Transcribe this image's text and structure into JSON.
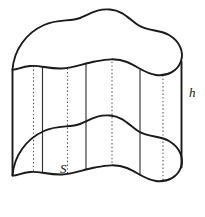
{
  "figure": {
    "type": "geometry-diagram",
    "background_color": "#ffffff",
    "stroke_color": "#1a1a1a",
    "hidden_stroke_color": "#555555",
    "width_px": 205,
    "height_px": 217,
    "labels": {
      "cross_section": "S",
      "height": "h"
    },
    "label_positions": {
      "cross_section": {
        "x": 60,
        "y": 162
      },
      "height": {
        "x": 189,
        "y": 86
      }
    },
    "geometry": {
      "height_offset_px": 106,
      "top_face_center": {
        "x": 98,
        "y": 52
      },
      "bottom_face_center": {
        "x": 98,
        "y": 158
      },
      "top_face_path": "M 12.5,69.5 C 14,50 26,33 44,25 C 58,18.5 70,22 80,18 C 91,13.5 97,8.5 110,9.5 C 123,10.5 129,19 138,25 C 148,31.5 160,29.5 169,35 C 180,41.5 184,52 181,61 C 178,70.5 168,76.5 156,75 C 145,73.6 137,66 127,62 C 116,57.6 106,59.5 95,61.5 C 83,63.7 74,68 62,68.5 C 48,69 40,65 30,66 C 21,66.9 15.5,70.5 12.5,69.5 Z",
      "bottom_face_path": "M 12.5,175.5 C 14,156 26,139 44,131 C 58,124.5 70,128 80,124 C 91,119.5 97,114.5 110,115.5 C 123,116.5 129,125 138,131 C 148,137.5 160,135.5 169,141 C 180,147.5 184,158 181,167 C 178,176.5 168,182.5 156,181 C 145,179.6 137,172 127,168 C 116,163.6 106,165.5 95,167.5 C 83,169.7 74,174 62,174.5 C 48,175 40,171 30,172 C 21,172.9 15.5,176.5 12.5,175.5 Z",
      "silhouette_left_x": 12.5,
      "silhouette_right_x": 181.5,
      "ruling_lines": [
        {
          "id": "ruling-1",
          "x": 33.5,
          "style": "dotted",
          "y_top": 65.8,
          "y_bottom": 171.8
        },
        {
          "id": "ruling-2",
          "x": 42.5,
          "style": "solid",
          "y_top": 66.5,
          "y_bottom": 172.6
        },
        {
          "id": "ruling-3",
          "x": 67.5,
          "style": "dotted",
          "y_top": 68.3,
          "y_bottom": 174.2
        },
        {
          "id": "ruling-4",
          "x": 86.0,
          "style": "solid",
          "y_top": 63.0,
          "y_bottom": 169.0
        },
        {
          "id": "ruling-5",
          "x": 112.0,
          "style": "dotted",
          "y_top": 58.0,
          "y_bottom": 164.0
        },
        {
          "id": "ruling-6",
          "x": 140.0,
          "style": "solid",
          "y_top": 69.5,
          "y_bottom": 175.5
        },
        {
          "id": "ruling-7",
          "x": 163.0,
          "style": "dotted",
          "y_top": 75.0,
          "y_bottom": 181.0
        }
      ]
    }
  }
}
